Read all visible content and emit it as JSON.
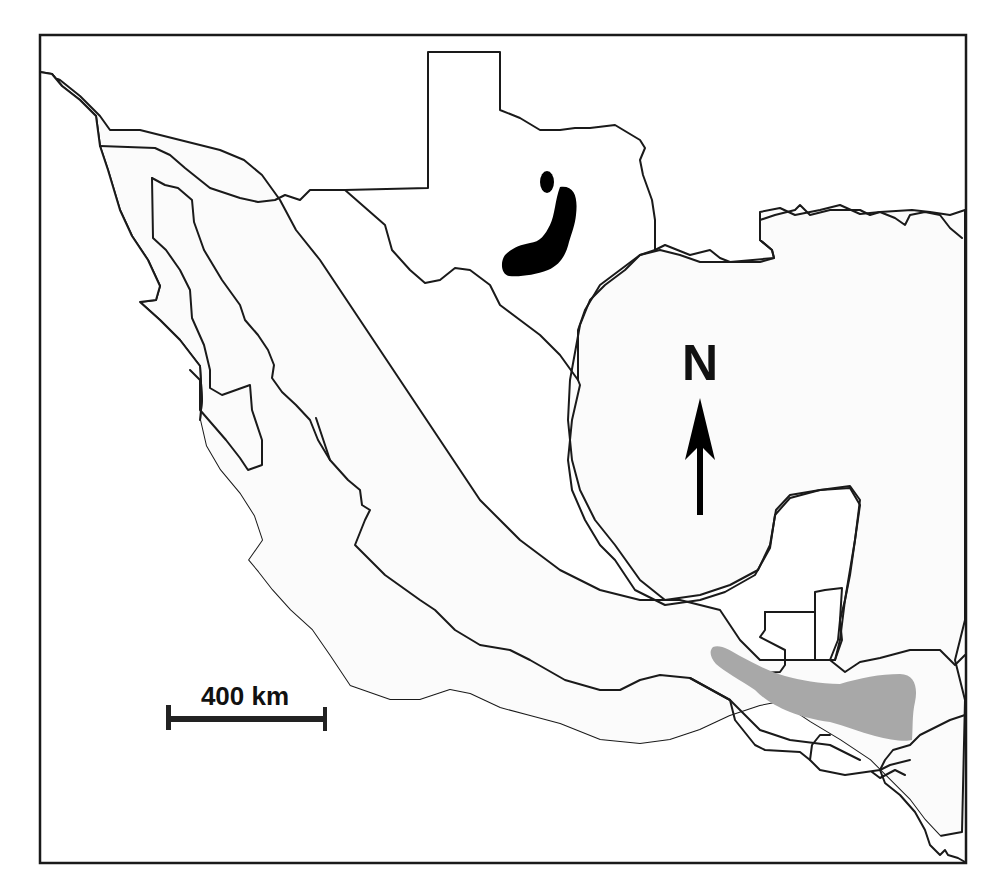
{
  "map": {
    "north_arrow": {
      "label": "N"
    },
    "scale_bar": {
      "label": "400 km"
    },
    "ranges": [
      {
        "name": "northern-range",
        "color": "#000000",
        "region": "central Texas"
      },
      {
        "name": "southern-range",
        "color": "#a8a8a8",
        "region": "southern Mexico / Guatemala / Honduras highlands"
      }
    ],
    "colors": {
      "land": "#fbfbfb",
      "water": "#ffffff",
      "outline": "#1a1a1a"
    }
  }
}
